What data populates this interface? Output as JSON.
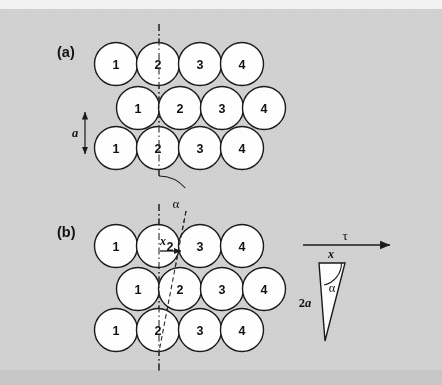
{
  "figure": {
    "background_color": "#d2d2d2",
    "top_strip_color": "#f4f4f4",
    "bottom_strip_color": "#c8c8c8",
    "circle_fill": "#ffffff",
    "circle_stroke": "#1a1a1a",
    "line_color": "#1a1a1a",
    "width": 442,
    "height": 385
  },
  "panels": [
    {
      "id": "panel-a",
      "label": "(a)",
      "label_x": 57,
      "label_y": 57,
      "rows": [
        {
          "id": "row-a-top",
          "y": 64,
          "x_start": 116,
          "labels": [
            "1",
            "2",
            "3",
            "4"
          ]
        },
        {
          "id": "row-a-middle",
          "y": 108,
          "x_start": 138,
          "labels": [
            "1",
            "2",
            "3",
            "4"
          ]
        },
        {
          "id": "row-a-bottom",
          "y": 148,
          "x_start": 116,
          "labels": [
            "1",
            "2",
            "3",
            "4"
          ]
        }
      ],
      "circle_radius": 21.5,
      "circle_spacing": 42,
      "vertical_dashdot_line": {
        "x": 159,
        "y1": 24,
        "y2": 178
      },
      "spacing_arrow": {
        "name": "lattice-spacing-a",
        "label": "a",
        "label_x": 72,
        "label_y": 133,
        "x": 85,
        "y_top": 110,
        "y_bottom": 155
      }
    },
    {
      "id": "panel-b",
      "label": "(b)",
      "label_x": 57,
      "label_y": 237,
      "rows": [
        {
          "id": "row-b-top",
          "y": 246,
          "x_start": 116,
          "labels": [
            "1",
            "2",
            "3",
            "4"
          ]
        },
        {
          "id": "row-b-middle",
          "y": 289,
          "x_start": 138,
          "labels": [
            "1",
            "2",
            "3",
            "4"
          ]
        },
        {
          "id": "row-b-bottom",
          "y": 330,
          "x_start": 116,
          "labels": [
            "1",
            "2",
            "3",
            "4"
          ]
        }
      ],
      "circle_radius": 21.5,
      "circle_spacing": 42,
      "vertical_dashdot_line": {
        "x": 159,
        "y1": 204,
        "y2": 372
      },
      "tilted_dashed_line": {
        "x1": 184,
        "y1": 212,
        "x2": 159,
        "y2": 352
      },
      "angle_alpha": {
        "name": "shear-angle-alpha",
        "label": "α",
        "label_x": 175,
        "label_y": 206,
        "arc_cx": 159,
        "arc_cy": 212,
        "arc_r": 36
      },
      "displacement_x": {
        "name": "displacement-x",
        "label": "x",
        "label_x": 170,
        "label_y": 243,
        "arrow_x1": 161,
        "arrow_x2": 182,
        "arrow_y": 251
      }
    }
  ],
  "shear_stress_arrow": {
    "name": "shear-stress-tau",
    "label": "τ",
    "label_x": 345,
    "label_y": 236,
    "x1": 303,
    "x2": 390,
    "y": 245
  },
  "strain_triangle": {
    "name": "strain-triangle",
    "apex_x": 324,
    "apex_y": 340,
    "top_left_x": 319,
    "top_left_y": 262,
    "top_right_x": 345,
    "top_right_y": 262,
    "fill": "#ffffff",
    "stroke": "#1a1a1a",
    "labels": {
      "top": "x",
      "top_x": 331,
      "top_y": 257,
      "angle": "α",
      "angle_x": 331,
      "angle_y": 288,
      "side": "2a",
      "side_x": 305,
      "side_y": 303
    },
    "angle_arc": {
      "cx": 319,
      "cy": 262,
      "r": 22
    }
  }
}
